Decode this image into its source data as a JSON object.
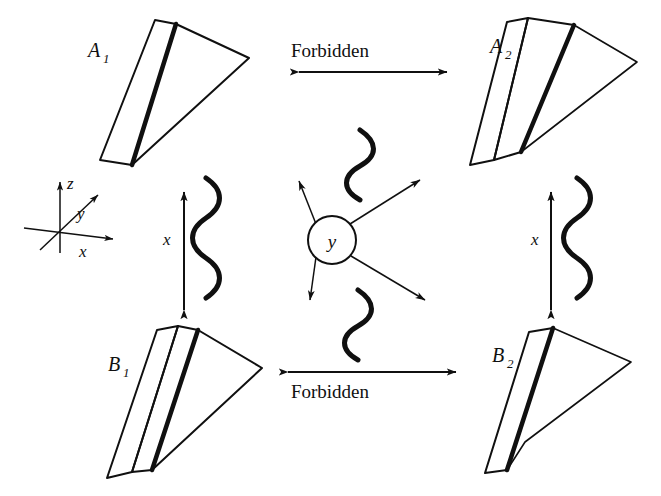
{
  "figure": {
    "background_color": "#ffffff",
    "ink_color": "#101010",
    "hatch_fill_color": "#b9b9b9",
    "white_fill_color": "#ffffff"
  },
  "axes_triad": {
    "name": "coordinate-axes",
    "origin": [
      60,
      228
    ],
    "labels": {
      "z": "z",
      "y": "y",
      "x": "x"
    }
  },
  "wedges": [
    {
      "id": "A1",
      "label": "A",
      "subscript": "1",
      "quadrant": "top-left",
      "shaded_faces": [
        "side-panel",
        "fan"
      ],
      "white_faces": []
    },
    {
      "id": "A2",
      "label": "A",
      "subscript": "2",
      "quadrant": "top-right",
      "shaded_faces": [
        "side-panel"
      ],
      "white_faces": [
        "edge-strip",
        "fan"
      ]
    },
    {
      "id": "B1",
      "label": "B",
      "subscript": "1",
      "quadrant": "bottom-left",
      "shaded_faces": [
        "side-panel",
        "fan"
      ],
      "white_faces": [
        "edge-strip"
      ]
    },
    {
      "id": "B2",
      "label": "B",
      "subscript": "2",
      "quadrant": "bottom-right",
      "shaded_faces": [
        "side-panel"
      ],
      "white_faces": [
        "fan"
      ]
    }
  ],
  "transitions": {
    "top": {
      "label": "Forbidden",
      "label_position": "above-arrow",
      "arrow": "double-headed-horizontal",
      "connects": [
        "A1",
        "A2"
      ]
    },
    "bottom": {
      "label": "Forbidden",
      "label_position": "below-arrow",
      "arrow": "double-headed-horizontal",
      "connects": [
        "B1",
        "B2"
      ]
    },
    "left": {
      "label": "x",
      "arrow": "double-headed-vertical",
      "connects": [
        "A1",
        "B1"
      ],
      "decoration": "squiggle"
    },
    "right": {
      "label": "x",
      "arrow": "double-headed-vertical",
      "connects": [
        "A2",
        "B2"
      ],
      "decoration": "squiggle"
    }
  },
  "center": {
    "name": "scattering-vertex",
    "circle_label": "y",
    "circle_center": [
      332,
      240
    ],
    "circle_radius": 24,
    "arrows": [
      {
        "direction": "up-left",
        "head": "double"
      },
      {
        "direction": "up-right",
        "head": "double"
      },
      {
        "direction": "down-left",
        "head": "double"
      },
      {
        "direction": "down-right",
        "head": "double"
      }
    ],
    "squiggles": [
      {
        "position": "above-circle"
      },
      {
        "position": "below-circle"
      }
    ]
  }
}
